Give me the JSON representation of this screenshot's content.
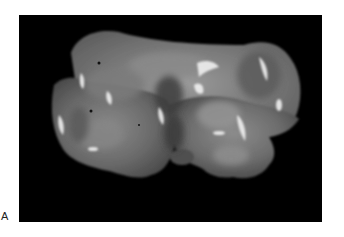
{
  "figure": {
    "panel_label": "A",
    "colors": {
      "page_background": "#ffffff",
      "photo_background": "#000000",
      "specimen_base": "#6e6e6e",
      "specimen_highlight": "#e8e8e8",
      "specimen_shadow": "#3a3a3a"
    }
  }
}
